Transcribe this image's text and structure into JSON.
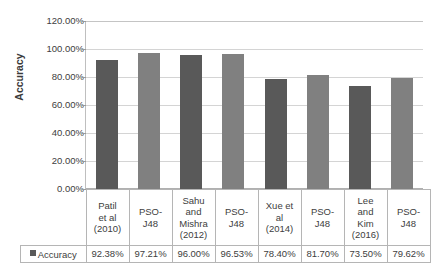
{
  "chart_data": {
    "type": "bar",
    "title": "",
    "xlabel": "",
    "ylabel": "Accuracy",
    "ylim": [
      0,
      120
    ],
    "ytick_labels": [
      "120.00%",
      "100.00%",
      "80.00%",
      "60.00%",
      "40.00%",
      "20.00%",
      "0.00%"
    ],
    "ytick_values": [
      120,
      100,
      80,
      60,
      40,
      20,
      0
    ],
    "grid": true,
    "legend": {
      "position": "bottom-table",
      "entries": [
        {
          "label": "Accuracy",
          "color": "#595959"
        }
      ]
    },
    "categories": [
      "Patil et al (2010)",
      "PSO-J48",
      "Sahu and Mishra (2012)",
      "PSO-J48",
      "Xue et al (2014)",
      "PSO-J48",
      "Lee and Kim (2016)",
      "PSO-J48"
    ],
    "category_lines": [
      [
        "Patil",
        "et al",
        "(2010)"
      ],
      [
        "PSO-",
        "J48"
      ],
      [
        "Sahu",
        "and",
        "Mishra",
        "(2012)"
      ],
      [
        "PSO-",
        "J48"
      ],
      [
        "Xue et",
        "al",
        "(2014)"
      ],
      [
        "PSO-",
        "J48"
      ],
      [
        "Lee",
        "and",
        "Kim",
        "(2016)"
      ],
      [
        "PSO-",
        "J48"
      ]
    ],
    "values": [
      92.38,
      97.21,
      96.0,
      96.53,
      78.4,
      81.7,
      73.5,
      79.62
    ],
    "value_labels": [
      "92.38%",
      "97.21%",
      "96.00%",
      "96.53%",
      "78.40%",
      "81.70%",
      "73.50%",
      "79.62%"
    ],
    "bar_colors": [
      "#595959",
      "#808080",
      "#595959",
      "#808080",
      "#595959",
      "#808080",
      "#595959",
      "#808080"
    ],
    "series": [
      {
        "name": "Accuracy",
        "values": [
          92.38,
          97.21,
          96.0,
          96.53,
          78.4,
          81.7,
          73.5,
          79.62
        ]
      }
    ]
  },
  "legend_row": {
    "label": "Accuracy",
    "swatch_color": "#595959"
  }
}
